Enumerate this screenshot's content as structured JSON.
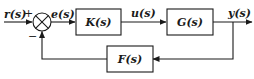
{
  "diagram": {
    "type": "feedback-control-block-diagram",
    "signals": {
      "input": "r(s)",
      "error": "e(s)",
      "control": "u(s)",
      "output": "y(s)"
    },
    "summing_junction": {
      "plus_sign": "+",
      "minus_sign": "−"
    },
    "blocks": {
      "controller": "K(s)",
      "plant": "G(s)",
      "feedback": "F(s)"
    }
  }
}
